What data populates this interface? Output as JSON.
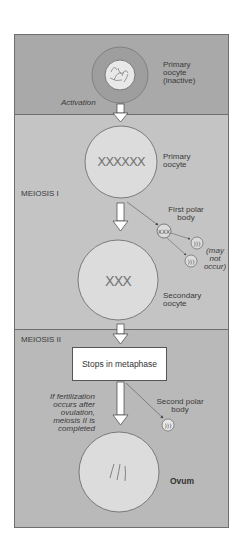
{
  "diagram": {
    "sections": [
      {
        "id": "activation",
        "label": ""
      },
      {
        "id": "meiosis-1",
        "label": "MEIOSIS I"
      },
      {
        "id": "meiosis-2",
        "label": "MEIOSIS II"
      }
    ],
    "labels": {
      "primary_oocyte_inactive_1": "Primary",
      "primary_oocyte_inactive_2": "oocyte",
      "primary_oocyte_inactive_3": "(inactive)",
      "activation": "Activation",
      "primary_oocyte_1": "Primary",
      "primary_oocyte_2": "oocyte",
      "meiosis_1": "MEIOSIS I",
      "first_polar_body_1": "First polar",
      "first_polar_body_2": "body",
      "may_not_occur_1": "(may",
      "may_not_occur_2": "not",
      "may_not_occur_3": "occur)",
      "secondary_oocyte_1": "Secondary",
      "secondary_oocyte_2": "oocyte",
      "meiosis_2": "MEIOSIS II",
      "stops_in_metaphase": "Stops in metaphase",
      "fertilization_1": "If fertilization",
      "fertilization_2": "occurs after",
      "fertilization_3": "ovulation,",
      "fertilization_4": "meiosis II is",
      "fertilization_5": "completed",
      "second_polar_body_1": "Second polar",
      "second_polar_body_2": "body",
      "ovum": "Ovum"
    },
    "colors": {
      "panel_activation": "#a9a9a9",
      "panel_meiosis_1": "#c4c4c4",
      "panel_meiosis_2": "#b9b9b9",
      "cell_fill": "#dcdcdc",
      "outline": "#6e6e6e"
    }
  }
}
